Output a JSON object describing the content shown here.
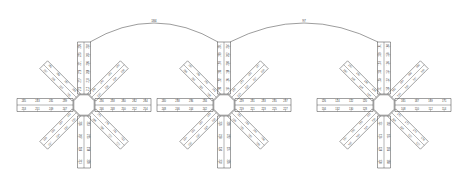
{
  "drawing": {
    "title": "Radial spoke assembly dimension drawing",
    "background_color": "#ffffff",
    "line_color": "#2b2b2b",
    "text_color": "#3a3a3a"
  },
  "arcs": [
    {
      "name": "arc-left-to-center",
      "label": "184",
      "from": "cluster-left",
      "to": "cluster-center"
    },
    {
      "name": "arc-center-to-right",
      "label": "97",
      "from": "cluster-center",
      "to": "cluster-right"
    }
  ],
  "clusters": [
    {
      "id": "cluster-left",
      "cx": 84,
      "cy": 105,
      "hub_radius": 11,
      "arms": [
        {
          "angle": -90,
          "length": 52,
          "width": 13,
          "left_labels": [
            "212",
            "210",
            "208",
            "206",
            "204",
            "202"
          ],
          "right_labels": [
            "215",
            "217",
            "219",
            "221",
            "223",
            "226"
          ]
        },
        {
          "angle": -45,
          "length": 46,
          "width": 11,
          "left_labels": [
            "230",
            "232",
            "234",
            "236"
          ],
          "right_labels": [
            "238",
            "240",
            "242",
            "244"
          ]
        },
        {
          "angle": 0,
          "length": 56,
          "width": 13,
          "left_labels": [
            "246",
            "248",
            "250",
            "252",
            "254"
          ],
          "right_labels": [
            "256",
            "258",
            "260",
            "262",
            "264"
          ]
        },
        {
          "angle": 45,
          "length": 46,
          "width": 11,
          "left_labels": [
            "266",
            "268",
            "270",
            "272"
          ],
          "right_labels": [
            "274",
            "276",
            "211",
            "213"
          ]
        },
        {
          "angle": 90,
          "length": 52,
          "width": 13,
          "left_labels": [
            "205",
            "207",
            "209",
            "211"
          ],
          "right_labels": [
            "213",
            "215",
            "218",
            "220"
          ]
        },
        {
          "angle": 135,
          "length": 46,
          "width": 11,
          "left_labels": [
            "222",
            "224",
            "226",
            "228"
          ],
          "right_labels": [
            "230",
            "232",
            "234",
            "237"
          ]
        },
        {
          "angle": 180,
          "length": 56,
          "width": 13,
          "left_labels": [
            "239",
            "241",
            "243",
            "245"
          ],
          "right_labels": [
            "247",
            "249",
            "251",
            "253"
          ]
        },
        {
          "angle": -135,
          "length": 46,
          "width": 11,
          "left_labels": [
            "255",
            "257",
            "259",
            "261"
          ],
          "right_labels": [
            "241",
            "243",
            "245",
            "247"
          ]
        }
      ]
    },
    {
      "id": "cluster-center",
      "cx": 224,
      "cy": 105,
      "hub_radius": 11,
      "arms": [
        {
          "angle": -90,
          "length": 52,
          "width": 13,
          "left_labels": [
            "194",
            "196",
            "198",
            "200",
            "202",
            "204"
          ],
          "right_labels": [
            "190",
            "192",
            "195",
            "197",
            "199",
            "201"
          ]
        },
        {
          "angle": -45,
          "length": 46,
          "width": 11,
          "left_labels": [
            "203",
            "205",
            "207",
            "209"
          ],
          "right_labels": [
            "211",
            "213",
            "215",
            "217"
          ]
        },
        {
          "angle": 0,
          "length": 56,
          "width": 13,
          "left_labels": [
            "219",
            "221",
            "223",
            "225",
            "227"
          ],
          "right_labels": [
            "229",
            "231",
            "233",
            "235",
            "237"
          ]
        },
        {
          "angle": 45,
          "length": 46,
          "width": 11,
          "left_labels": [
            "239",
            "241",
            "243",
            "245"
          ],
          "right_labels": [
            "213",
            "215",
            "244",
            "246"
          ]
        },
        {
          "angle": 90,
          "length": 52,
          "width": 13,
          "left_labels": [
            "226",
            "228",
            "230",
            "232"
          ],
          "right_labels": [
            "220",
            "222",
            "224",
            "226"
          ]
        },
        {
          "angle": 135,
          "length": 46,
          "width": 11,
          "left_labels": [
            "218",
            "220",
            "222",
            "224"
          ],
          "right_labels": [
            "226",
            "228",
            "230",
            "232"
          ]
        },
        {
          "angle": 180,
          "length": 56,
          "width": 13,
          "left_labels": [
            "234",
            "236",
            "238",
            "240"
          ],
          "right_labels": [
            "242",
            "244",
            "246",
            "248"
          ]
        },
        {
          "angle": -135,
          "length": 46,
          "width": 11,
          "left_labels": [
            "241",
            "243",
            "245",
            "247"
          ],
          "right_labels": [
            "249",
            "251",
            "253",
            "255"
          ]
        }
      ]
    },
    {
      "id": "cluster-right",
      "cx": 384,
      "cy": 105,
      "hub_radius": 11,
      "arms": [
        {
          "angle": -90,
          "length": 52,
          "width": 13,
          "left_labels": [
            "150",
            "152",
            "154",
            "156",
            "158",
            "160"
          ],
          "right_labels": [
            "151",
            "153",
            "155",
            "157",
            "159",
            "161"
          ]
        },
        {
          "angle": -45,
          "length": 46,
          "width": 11,
          "left_labels": [
            "143",
            "145",
            "147",
            "149"
          ],
          "right_labels": [
            "162",
            "164",
            "166",
            "168"
          ]
        },
        {
          "angle": 0,
          "length": 56,
          "width": 13,
          "left_labels": [
            "108",
            "110",
            "112",
            "114"
          ],
          "right_labels": [
            "165",
            "167",
            "169",
            "171"
          ]
        },
        {
          "angle": 45,
          "length": 46,
          "width": 11,
          "left_labels": [
            "116",
            "118",
            "120",
            "122"
          ],
          "right_labels": [
            "170",
            "172",
            "174",
            "176"
          ]
        },
        {
          "angle": 90,
          "length": 52,
          "width": 13,
          "left_labels": [
            "124",
            "126",
            "128",
            "130"
          ],
          "right_labels": [
            "162",
            "164",
            "166",
            "168"
          ]
        },
        {
          "angle": 135,
          "length": 46,
          "width": 11,
          "left_labels": [
            "131",
            "133",
            "135",
            "137"
          ],
          "right_labels": [
            "139",
            "141",
            "143",
            "145"
          ]
        },
        {
          "angle": 180,
          "length": 56,
          "width": 13,
          "left_labels": [
            "120",
            "122",
            "124",
            "126"
          ],
          "right_labels": [
            "128",
            "130",
            "132",
            "134"
          ]
        },
        {
          "angle": -135,
          "length": 46,
          "width": 11,
          "left_labels": [
            "136",
            "138",
            "140",
            "142"
          ],
          "right_labels": [
            "144",
            "146",
            "148",
            "150"
          ]
        }
      ]
    }
  ]
}
